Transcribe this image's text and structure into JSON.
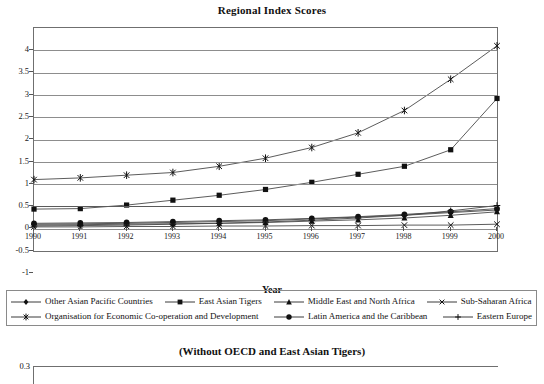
{
  "chart_data": {
    "type": "line",
    "title": "Regional Index Scores",
    "xlabel": "Year",
    "ylabel": "",
    "grid": true,
    "legend_position": "bottom",
    "categories": [
      "1990",
      "1991",
      "1992",
      "1993",
      "1994",
      "1995",
      "1996",
      "1997",
      "1998",
      "1999",
      "2000"
    ],
    "xlim": [
      "1990",
      "2000"
    ],
    "ylim": [
      -1,
      4
    ],
    "yticks": [
      "-1",
      "-0.5",
      "0",
      "0.5",
      "1",
      "1.5",
      "2",
      "2.5",
      "3",
      "3.5",
      "4"
    ],
    "series": [
      {
        "name": "Other Asian Pacific Countries",
        "marker": "diamond",
        "values": [
          -0.4,
          -0.39,
          -0.38,
          -0.36,
          -0.34,
          -0.32,
          -0.28,
          -0.24,
          -0.2,
          -0.14,
          -0.08
        ]
      },
      {
        "name": "East Asian Tigers",
        "marker": "square",
        "values": [
          -0.06,
          -0.05,
          0.03,
          0.14,
          0.25,
          0.38,
          0.54,
          0.72,
          0.9,
          1.27,
          2.42
        ]
      },
      {
        "name": "Middle East and North Africa",
        "marker": "triangle",
        "values": [
          -0.42,
          -0.41,
          -0.4,
          -0.39,
          -0.38,
          -0.36,
          -0.33,
          -0.3,
          -0.26,
          -0.2,
          -0.12
        ]
      },
      {
        "name": "Sub-Saharan Africa",
        "marker": "x",
        "values": [
          -0.46,
          -0.46,
          -0.45,
          -0.45,
          -0.44,
          -0.44,
          -0.43,
          -0.43,
          -0.42,
          -0.42,
          -0.4
        ]
      },
      {
        "name": "Organisation for Economic Co-operation and Development",
        "marker": "star",
        "values": [
          0.6,
          0.64,
          0.7,
          0.76,
          0.9,
          1.08,
          1.32,
          1.65,
          2.15,
          2.85,
          3.6
        ]
      },
      {
        "name": "Latin America and the Caribbean",
        "marker": "circle",
        "values": [
          -0.38,
          -0.37,
          -0.36,
          -0.34,
          -0.32,
          -0.3,
          -0.27,
          -0.23,
          -0.18,
          -0.12,
          -0.05
        ]
      },
      {
        "name": "Eastern Europe",
        "marker": "plus",
        "values": [
          -0.44,
          -0.43,
          -0.42,
          -0.4,
          -0.38,
          -0.35,
          -0.31,
          -0.26,
          -0.2,
          -0.1,
          0.02
        ]
      }
    ]
  },
  "subchart": {
    "title": "(Without OECD and East Asian Tigers)",
    "first_ytick": "0.3"
  },
  "colors": {
    "line": "#555555",
    "grid": "#8d8d8d",
    "axis": "#6f6f6f",
    "text": "#111111"
  }
}
